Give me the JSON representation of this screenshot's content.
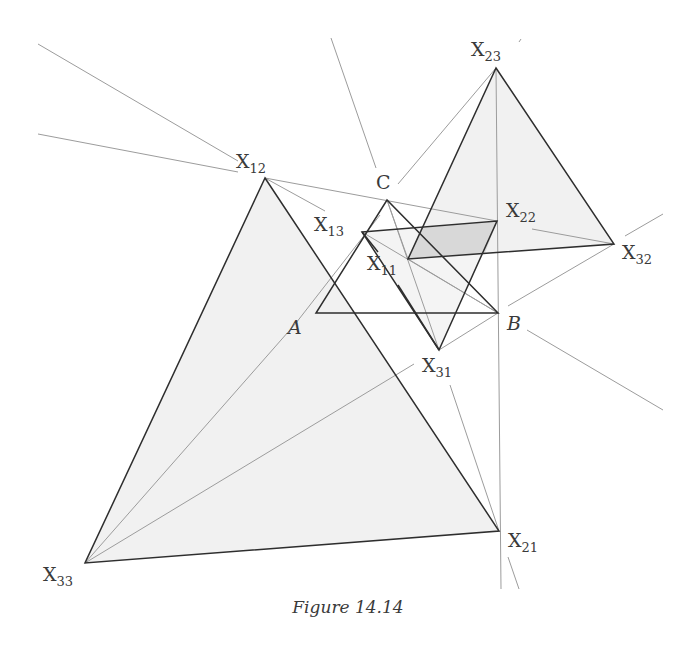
{
  "figure": {
    "caption": "Figure 14.14",
    "colors": {
      "thick_line": "#2e2e2e",
      "thin_line": "#9a9a9a",
      "fill_light": "#efefef",
      "fill_parallelogram": "#d9d9d9",
      "label": "#3a3a3a"
    }
  },
  "points": {
    "A": {
      "label": "A",
      "sub": "",
      "x": 316,
      "y": 313
    },
    "B": {
      "label": "B",
      "sub": "",
      "x": 498,
      "y": 313
    },
    "C": {
      "label": "C",
      "sub": "",
      "x": 387,
      "y": 200
    },
    "X11": {
      "label": "X",
      "sub": "11",
      "x": 408,
      "y": 259
    },
    "X12": {
      "label": "X",
      "sub": "12",
      "x": 265,
      "y": 178
    },
    "X13": {
      "label": "X",
      "sub": "13",
      "x": 362,
      "y": 232
    },
    "X21": {
      "label": "X",
      "sub": "21",
      "x": 499,
      "y": 531
    },
    "X22": {
      "label": "X",
      "sub": "22",
      "x": 497,
      "y": 221
    },
    "X23": {
      "label": "X",
      "sub": "23",
      "x": 496,
      "y": 68
    },
    "X31": {
      "label": "X",
      "sub": "31",
      "x": 439,
      "y": 350
    },
    "X32": {
      "label": "X",
      "sub": "32",
      "x": 614,
      "y": 244
    },
    "X33": {
      "label": "X",
      "sub": "33",
      "x": 85,
      "y": 563
    }
  },
  "labels": {
    "A": {
      "main": "A",
      "sub": ""
    },
    "B": {
      "main": "B",
      "sub": ""
    },
    "C": {
      "main": "C",
      "sub": ""
    },
    "X11": {
      "main": "X",
      "sub": "11"
    },
    "X12": {
      "main": "X",
      "sub": "12"
    },
    "X13": {
      "main": "X",
      "sub": "13"
    },
    "X21": {
      "main": "X",
      "sub": "21"
    },
    "X22": {
      "main": "X",
      "sub": "22"
    },
    "X23": {
      "main": "X",
      "sub": "23"
    },
    "X31": {
      "main": "X",
      "sub": "31"
    },
    "X32": {
      "main": "X",
      "sub": "32"
    },
    "X33": {
      "main": "X",
      "sub": "33"
    }
  },
  "triangles": [
    {
      "name": "triangle-ABC",
      "vertices": [
        "A",
        "B",
        "C"
      ]
    },
    {
      "name": "triangle-X12-X21-X33",
      "vertices": [
        "X12",
        "X21",
        "X33"
      ]
    },
    {
      "name": "triangle-X23-X32-X11",
      "vertices": [
        "X23",
        "X32",
        "X11"
      ]
    },
    {
      "name": "triangle-X13-X22-X31",
      "vertices": [
        "X13",
        "X22",
        "X31"
      ]
    }
  ]
}
